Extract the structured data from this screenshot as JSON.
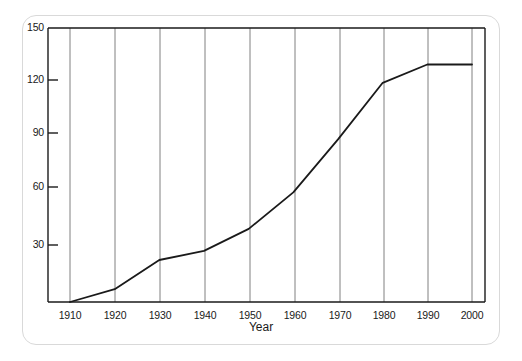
{
  "chart_data": {
    "type": "line",
    "title": "",
    "subtitle": "",
    "xlabel": "Year",
    "ylabel": "",
    "x": [
      1910,
      1920,
      1930,
      1940,
      1950,
      1960,
      1970,
      1980,
      1990,
      2000
    ],
    "values": [
      0,
      7,
      23,
      28,
      40,
      60,
      89,
      120,
      130,
      130
    ],
    "series": [
      {
        "name": "",
        "values": [
          0,
          7,
          23,
          28,
          40,
          60,
          89,
          120,
          130,
          130
        ]
      }
    ],
    "xlim": [
      1910,
      2000
    ],
    "ylim": [
      0,
      150
    ],
    "xticks": [
      1910,
      1920,
      1930,
      1940,
      1950,
      1960,
      1970,
      1980,
      1990,
      2000
    ],
    "xticklabels": [
      "1910",
      "1920",
      "1930",
      "1940",
      "1950",
      "1960",
      "1970",
      "1980",
      "1990",
      "2000"
    ],
    "yticks": [
      30,
      60,
      90,
      120,
      150
    ],
    "yticklabels": [
      "30",
      "60",
      "90",
      "120",
      "150"
    ],
    "grid": "vertical-only",
    "legend": "none",
    "line_color": "#1a1a1a",
    "grid_color": "#808080",
    "axis_color": "#1a1a1a",
    "frame_color": "#d9d9d9",
    "background": "#ffffff"
  },
  "axis": {
    "x_title": "Year"
  }
}
